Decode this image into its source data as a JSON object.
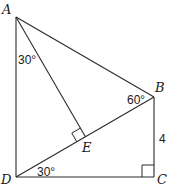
{
  "diagram": {
    "type": "geometry",
    "points": {
      "A": {
        "label": "A",
        "x": 16,
        "y": 17
      },
      "B": {
        "label": "B",
        "x": 154,
        "y": 97
      },
      "C": {
        "label": "C",
        "x": 154,
        "y": 177
      },
      "D": {
        "label": "D",
        "x": 16,
        "y": 177
      },
      "E": {
        "label": "E",
        "x": 85.4,
        "y": 136.8
      }
    },
    "segments": [
      "AD",
      "DC",
      "CB",
      "BA",
      "DB",
      "AE"
    ],
    "angles": {
      "DAE": "30°",
      "ABD": "60°",
      "BDC": "30°"
    },
    "right_angles": [
      "C",
      "E"
    ],
    "lengths": {
      "BC": "4"
    }
  }
}
